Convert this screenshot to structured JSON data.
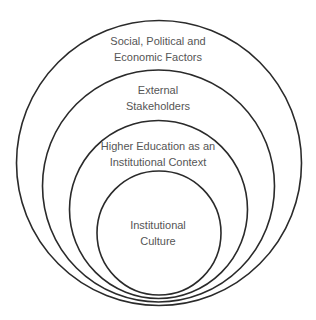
{
  "diagram": {
    "type": "nested-circles",
    "stroke_color": "#2a2a2a",
    "text_color": "#555555",
    "layers": [
      {
        "level": 1,
        "lines": [
          "Social, Political and",
          "Economic Factors"
        ]
      },
      {
        "level": 2,
        "lines": [
          "External",
          "Stakeholders"
        ]
      },
      {
        "level": 3,
        "lines": [
          "Higher Education as an",
          "Institutional Context"
        ]
      },
      {
        "level": 4,
        "lines": [
          "Institutional",
          "Culture"
        ]
      }
    ]
  }
}
